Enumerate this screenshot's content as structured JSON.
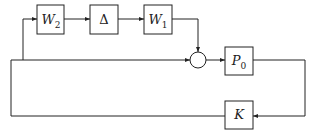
{
  "diagram": {
    "type": "feedback-block-diagram",
    "blocks": [
      {
        "id": "W2",
        "label": "W",
        "sub": "2"
      },
      {
        "id": "Delta",
        "label": "Δ",
        "sub": ""
      },
      {
        "id": "W1",
        "label": "W",
        "sub": "1"
      },
      {
        "id": "P0",
        "label": "P",
        "sub": "0"
      },
      {
        "id": "K",
        "label": "K",
        "sub": ""
      }
    ],
    "junctions": [
      {
        "id": "sum",
        "type": "summing-circle"
      }
    ],
    "connections": [
      {
        "from": "branch",
        "to": "W2"
      },
      {
        "from": "W2",
        "to": "Delta"
      },
      {
        "from": "Delta",
        "to": "W1"
      },
      {
        "from": "W1",
        "to": "sum"
      },
      {
        "from": "main-line",
        "to": "sum"
      },
      {
        "from": "sum",
        "to": "P0"
      },
      {
        "from": "P0",
        "to": "K"
      },
      {
        "from": "K",
        "to": "main-line"
      }
    ],
    "colors": {
      "stroke": "#222222",
      "background": "#ffffff"
    }
  }
}
